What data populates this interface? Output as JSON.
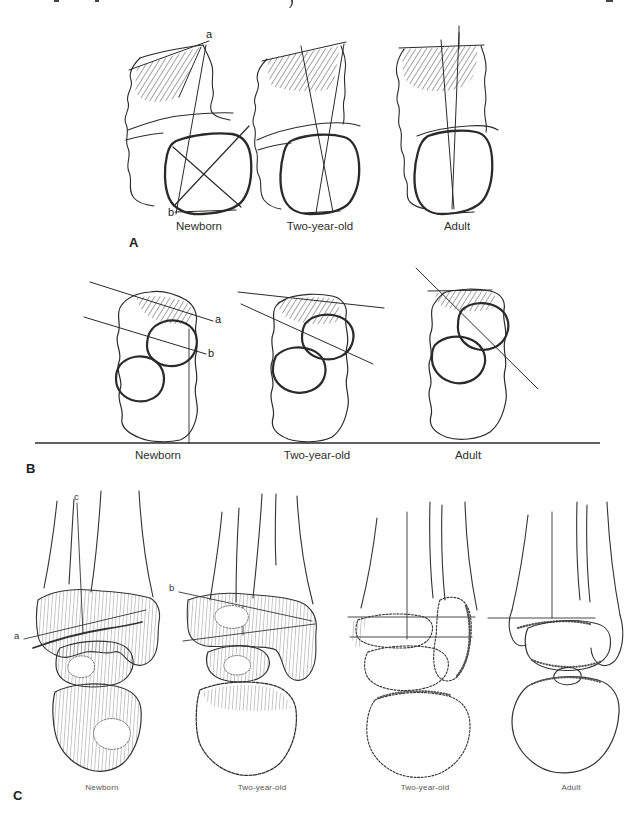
{
  "colors": {
    "background": "#ffffff",
    "ink": "#222222",
    "hatch": "#3a3a3a",
    "caption_text": "#2e2e2e"
  },
  "panels": [
    {
      "id": "A",
      "label": "A",
      "markers": {
        "a": "a",
        "b": "b"
      },
      "captions": [
        "Newborn",
        "Two-year-old",
        "Adult"
      ]
    },
    {
      "id": "B",
      "label": "B",
      "markers": {
        "a": "a",
        "b": "b"
      },
      "captions": [
        "Newborn",
        "Two-year-old",
        "Adult"
      ]
    },
    {
      "id": "C",
      "label": "C",
      "markers": {
        "a": "a",
        "b": "b",
        "c": "c"
      },
      "captions": [
        "Newborn",
        "Two-year-old",
        "Two-year-old",
        "Adult"
      ]
    }
  ]
}
